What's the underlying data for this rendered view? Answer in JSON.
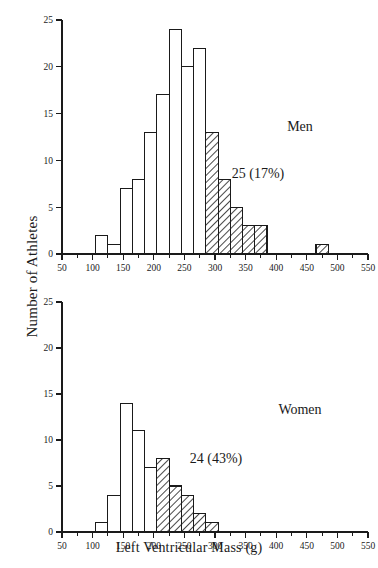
{
  "chart_data": [
    {
      "type": "bar",
      "title": "",
      "group_label": "Men",
      "annotation": "25 (17%)",
      "xlabel": "Left Ventricular Mass (g)",
      "ylabel": "Number of Athletes",
      "xlim": [
        50,
        550
      ],
      "ylim": [
        0,
        25
      ],
      "xticks": [
        50,
        100,
        150,
        200,
        250,
        300,
        350,
        400,
        450,
        500,
        550
      ],
      "xtick_labels": [
        "50",
        "100",
        "150",
        "200",
        "250",
        "300",
        "350",
        "400",
        "450",
        "500",
        "550"
      ],
      "minor_xtick_step": 25,
      "yticks": [
        0,
        5,
        10,
        15,
        20,
        25
      ],
      "ytick_labels": [
        "0",
        "5",
        "10",
        "15",
        "20",
        "25"
      ],
      "grid": false,
      "bin_width": 20,
      "bins": [
        {
          "x0": 105,
          "x1": 125,
          "value": 2,
          "fill": "open"
        },
        {
          "x0": 125,
          "x1": 145,
          "value": 1,
          "fill": "open"
        },
        {
          "x0": 145,
          "x1": 165,
          "value": 7,
          "fill": "open"
        },
        {
          "x0": 165,
          "x1": 185,
          "value": 8,
          "fill": "open"
        },
        {
          "x0": 185,
          "x1": 205,
          "value": 13,
          "fill": "open"
        },
        {
          "x0": 205,
          "x1": 225,
          "value": 17,
          "fill": "open"
        },
        {
          "x0": 225,
          "x1": 245,
          "value": 24,
          "fill": "open"
        },
        {
          "x0": 245,
          "x1": 265,
          "value": 20,
          "fill": "open"
        },
        {
          "x0": 265,
          "x1": 285,
          "value": 22,
          "fill": "open"
        },
        {
          "x0": 285,
          "x1": 305,
          "value": 13,
          "fill": "hatched"
        },
        {
          "x0": 305,
          "x1": 325,
          "value": 8,
          "fill": "hatched"
        },
        {
          "x0": 325,
          "x1": 345,
          "value": 5,
          "fill": "hatched"
        },
        {
          "x0": 345,
          "x1": 365,
          "value": 3,
          "fill": "hatched"
        },
        {
          "x0": 365,
          "x1": 385,
          "value": 3,
          "fill": "hatched"
        },
        {
          "x0": 465,
          "x1": 485,
          "value": 1,
          "fill": "hatched"
        }
      ]
    },
    {
      "type": "bar",
      "title": "",
      "group_label": "Women",
      "annotation": "24 (43%)",
      "xlabel": "Left Ventricular Mass (g)",
      "ylabel": "Number of Athletes",
      "xlim": [
        50,
        550
      ],
      "ylim": [
        0,
        25
      ],
      "xticks": [
        50,
        100,
        150,
        200,
        250,
        300,
        350,
        400,
        450,
        500,
        550
      ],
      "xtick_labels": [
        "50",
        "100",
        "150",
        "200",
        "250",
        "300",
        "350",
        "400",
        "450",
        "500",
        "550"
      ],
      "minor_xtick_step": 25,
      "yticks": [
        0,
        5,
        10,
        15,
        20,
        25
      ],
      "ytick_labels": [
        "0",
        "5",
        "10",
        "15",
        "20",
        "25"
      ],
      "grid": false,
      "bin_width": 20,
      "bins": [
        {
          "x0": 105,
          "x1": 125,
          "value": 1,
          "fill": "open"
        },
        {
          "x0": 125,
          "x1": 145,
          "value": 4,
          "fill": "open"
        },
        {
          "x0": 145,
          "x1": 165,
          "value": 14,
          "fill": "open"
        },
        {
          "x0": 165,
          "x1": 185,
          "value": 11,
          "fill": "open"
        },
        {
          "x0": 185,
          "x1": 205,
          "value": 7,
          "fill": "open"
        },
        {
          "x0": 205,
          "x1": 225,
          "value": 8,
          "fill": "hatched"
        },
        {
          "x0": 225,
          "x1": 245,
          "value": 5,
          "fill": "hatched"
        },
        {
          "x0": 245,
          "x1": 265,
          "value": 4,
          "fill": "hatched"
        },
        {
          "x0": 265,
          "x1": 285,
          "value": 2,
          "fill": "hatched"
        },
        {
          "x0": 285,
          "x1": 305,
          "value": 1,
          "fill": "hatched"
        }
      ]
    }
  ],
  "figure": {
    "y_axis_title": "Number of Athletes",
    "x_axis_title": "Left Ventricular Mass (g)",
    "panels": [
      {
        "id": "men",
        "group_label": "Men",
        "annotation": "25 (17%)",
        "group_label_x": 300,
        "group_label_y": 125,
        "annotation_x": 258,
        "annotation_y": 172
      },
      {
        "id": "women",
        "group_label": "Women",
        "annotation": "24 (43%)",
        "group_label_x": 300,
        "group_label_y": 126,
        "annotation_x": 216,
        "annotation_y": 175
      }
    ]
  },
  "colors": {
    "ink": "#1a1a1a",
    "background": "#ffffff",
    "bar_open_fill": "#ffffff",
    "bar_hatch_stroke": "#1a1a1a"
  }
}
